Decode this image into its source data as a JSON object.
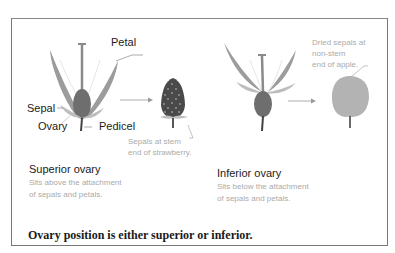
{
  "figure": {
    "caption": "Ovary position is either superior or inferior.",
    "colors": {
      "petal": "#9c9c9c",
      "sepal": "#bdbdbd",
      "ovary": "#6e6e6e",
      "stem": "#444444",
      "strawberry": "#4a4a4a",
      "apple": "#b3b3b3",
      "label_text": "#222222",
      "note_text": "#aaaaaa",
      "border": "#777777"
    },
    "left_panel": {
      "labels": {
        "petal": "Petal",
        "sepal": "Sepal",
        "ovary": "Ovary",
        "pedicel": "Pedicel"
      },
      "fruit_note": "Sepals at stem\nend of strawberry.",
      "title": "Superior ovary",
      "description": "Sits above the attachment\nof sepals and petals."
    },
    "right_panel": {
      "fruit_note": "Dried sepals at\nnon-stem\nend of apple.",
      "title": "Inferior ovary",
      "description": "Sits below the attachment\nof sepals and petals."
    }
  }
}
